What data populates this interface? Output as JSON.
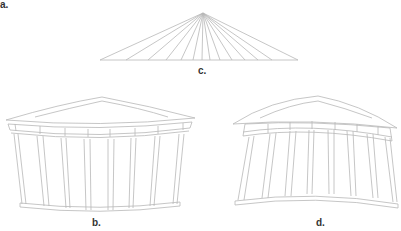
{
  "figure": {
    "labels": {
      "a": "a.",
      "b": "b.",
      "c": "c.",
      "d": "d."
    },
    "colors": {
      "stroke": "#b8b8b8",
      "label": "#333333",
      "background": "#ffffff"
    },
    "panels": [
      {
        "id": "c",
        "description": "Fan of converging lines meeting at a single apex above a horizontal base line (perspective rays)",
        "ray_count": 16
      },
      {
        "id": "b",
        "description": "Temple facade with pediment, entablature and 8 columns drawn with inward-curving (convex) horizontal lines"
      },
      {
        "id": "d",
        "description": "Temple facade with pediment, entablature and 8 columns drawn with upward-arching (concave) horizontal lines"
      }
    ]
  }
}
